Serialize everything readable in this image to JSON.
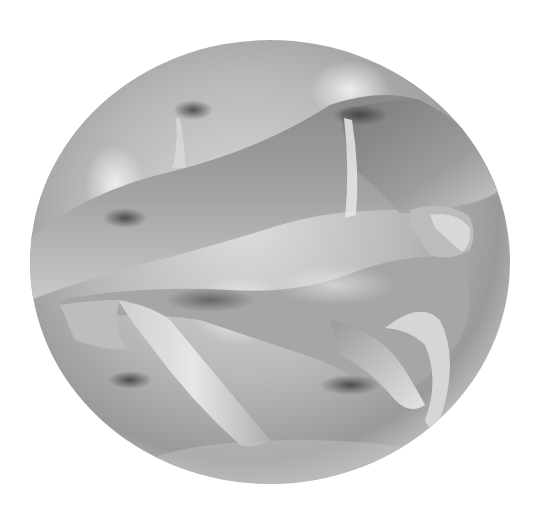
{
  "image": {
    "subject": "Grayscale 3D render of a self-intersecting mathematical surface (knotted ribbon over a sphere)",
    "background_color": "#ffffff",
    "palette": {
      "highlight": "#f2f2f2",
      "light": "#d0d0d0",
      "mid": "#a8a8a8",
      "shadow": "#6e6e6e",
      "deep_shadow": "#3c3c3c"
    },
    "width": 542,
    "height": 517
  }
}
